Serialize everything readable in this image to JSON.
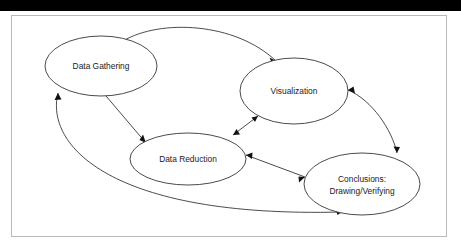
{
  "page": {
    "background_color": "#ffffff",
    "top_bar_color": "#000000",
    "frame_border_color": "#b9b9b9"
  },
  "diagram": {
    "type": "cyclic-process-flow",
    "stroke_color": "#2b2b2b",
    "text_color": "#1a1a1a",
    "nodes": [
      {
        "id": "data-gathering",
        "label": "Data Gathering",
        "lines": [
          "Data Gathering"
        ],
        "shape": "ellipse",
        "cx": 101,
        "cy": 66,
        "rx": 56,
        "ry": 30
      },
      {
        "id": "visualization",
        "label": "Visualization",
        "lines": [
          "Visualization"
        ],
        "shape": "ellipse",
        "cx": 294,
        "cy": 91,
        "rx": 54,
        "ry": 33
      },
      {
        "id": "data-reduction",
        "label": "Data Reduction",
        "lines": [
          "Data Reduction"
        ],
        "shape": "ellipse",
        "cx": 188,
        "cy": 159,
        "rx": 58,
        "ry": 26
      },
      {
        "id": "conclusions",
        "label": "Conclusions: Drawing/Verifying",
        "lines": [
          "Conclusions:",
          "Drawing/Verifying"
        ],
        "shape": "ellipse",
        "cx": 362,
        "cy": 184,
        "rx": 58,
        "ry": 31
      }
    ],
    "edges": [
      {
        "id": "gathering-to-visualization",
        "from": "data-gathering",
        "to": "visualization",
        "direction": "one-way",
        "style": "curved"
      },
      {
        "id": "gathering-to-reduction",
        "from": "data-gathering",
        "to": "data-reduction",
        "direction": "one-way",
        "style": "straight"
      },
      {
        "id": "reduction-to-visualization",
        "from": "data-reduction",
        "to": "visualization",
        "direction": "two-way",
        "style": "straight"
      },
      {
        "id": "visualization-to-conclusions",
        "from": "visualization",
        "to": "conclusions",
        "direction": "two-way",
        "style": "curved"
      },
      {
        "id": "reduction-to-conclusions",
        "from": "data-reduction",
        "to": "conclusions",
        "direction": "two-way",
        "style": "straight"
      },
      {
        "id": "conclusions-to-gathering",
        "from": "conclusions",
        "to": "data-gathering",
        "direction": "two-way",
        "style": "curved"
      }
    ]
  }
}
